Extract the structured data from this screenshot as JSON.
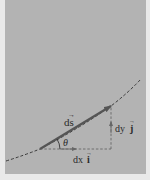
{
  "diagram": {
    "background_color": "#b3b3b3",
    "border_color": "#e9e9e9",
    "curve_color": "#3a3a3a",
    "vector_color": "#555555",
    "components_color": "#555555",
    "labels": {
      "ds": "ds",
      "ds_vector_arrow": "→",
      "theta": "θ",
      "dx": "dx",
      "i_hat": "i",
      "dy": "dy",
      "j_hat": "j",
      "unit_arrow": "→"
    }
  }
}
